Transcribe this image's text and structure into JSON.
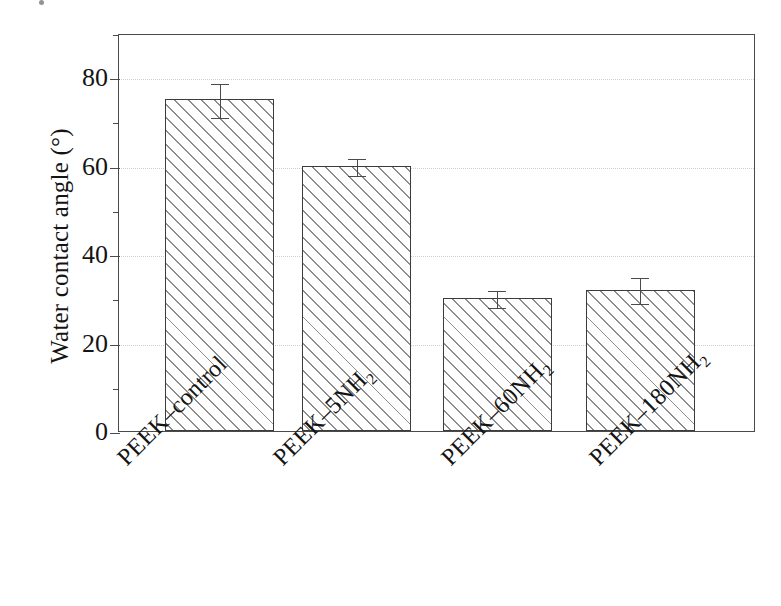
{
  "chart_data": {
    "type": "bar",
    "title": "",
    "xlabel": "",
    "ylabel": "Water contact angle (°)",
    "categories": [
      "PEEK–control",
      "PEEK–5NH2",
      "PEEK–60NH2",
      "PEEK–180NH2"
    ],
    "category_labels_html": [
      "PEEK–control",
      "PEEK–5NH<sub>2</sub>",
      "PEEK–60NH<sub>2</sub>",
      "PEEK–180NH<sub>2</sub>"
    ],
    "values": [
      75,
      60,
      30,
      32
    ],
    "errors": [
      4,
      2,
      2,
      3
    ],
    "ylim": [
      0,
      90
    ],
    "ytick_labels": [
      "0",
      "20",
      "40",
      "60",
      "80"
    ],
    "ytick_values": [
      0,
      20,
      40,
      60,
      80
    ],
    "yminor_values": [
      10,
      30,
      50,
      70,
      90
    ],
    "grid": "horizontal-dotted-at-major-ticks",
    "legend": "none",
    "bar_fill": "diagonal-hatch-45deg",
    "bar_edge_color": "#3c3c3c",
    "grid_color": "#cfcfcf",
    "axis_color": "#4a4a4a",
    "background": "#ffffff",
    "error_bar_style": "capped-vertical",
    "xtick_label_rotation": -45
  }
}
